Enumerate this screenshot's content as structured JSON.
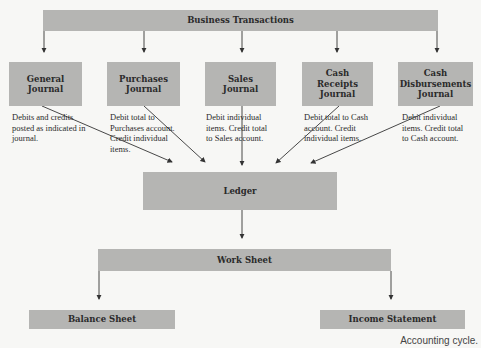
{
  "title": "Accounting cycle.",
  "top": {
    "label": "Business Transactions"
  },
  "journals": [
    {
      "label": "General\nJournal",
      "note": "Debits and credits posted as indicated in journal."
    },
    {
      "label": "Purchases\nJournal",
      "note": "Debit total to Purchases account. Credit individual items."
    },
    {
      "label": "Sales\nJournal",
      "note": "Debit individual items.  Credit total to Sales account."
    },
    {
      "label": "Cash\nReceipts\nJournal",
      "note": "Debit total to Cash account. Credit individual items."
    },
    {
      "label": "Cash\nDisbursements\nJournal",
      "note": "Debit individual items.  Credit total to Cash account."
    }
  ],
  "ledger": {
    "label": "Ledger"
  },
  "worksheet": {
    "label": "Work Sheet"
  },
  "outputs": [
    {
      "label": "Balance Sheet"
    },
    {
      "label": "Income Statement"
    }
  ],
  "colors": {
    "box": "#b5b5b3",
    "line": "#333333",
    "background": "#f7f7f5"
  }
}
